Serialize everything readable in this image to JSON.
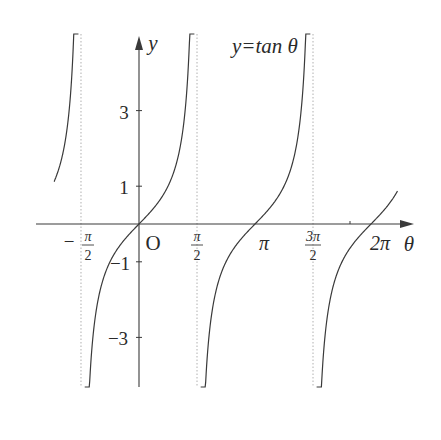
{
  "chart_data": {
    "type": "line",
    "title": "y=tan θ",
    "function": "tan",
    "xlabel": "θ",
    "ylabel": "y",
    "origin_label": "O",
    "x_range": [
      -2.3,
      7.0
    ],
    "y_range": [
      -5.0,
      5.0
    ],
    "x_ticks": [
      {
        "value": -1.5708,
        "label": "−π/2",
        "num": "π",
        "den": "2",
        "neg": true,
        "frac": true
      },
      {
        "value": 1.5708,
        "label": "π/2",
        "num": "π",
        "den": "2",
        "neg": false,
        "frac": true
      },
      {
        "value": 3.1416,
        "label": "π",
        "frac": false
      },
      {
        "value": 4.7124,
        "label": "3π/2",
        "num": "3π",
        "den": "2",
        "neg": false,
        "frac": true
      },
      {
        "value": 6.2832,
        "label": "2π",
        "frac": false
      }
    ],
    "y_ticks": [
      {
        "value": 3,
        "label": "3"
      },
      {
        "value": 1,
        "label": "1"
      },
      {
        "value": -1,
        "label": "−1"
      },
      {
        "value": -3,
        "label": "−3"
      }
    ],
    "asymptotes": [
      -1.5708,
      1.5708,
      4.7124
    ],
    "branches": [
      {
        "x_from": -2.3,
        "x_to": -1.64,
        "note": "right end of branch left of −π/2"
      },
      {
        "x_from": -1.47,
        "x_to": 1.5,
        "note": "principal branch through origin"
      },
      {
        "x_from": 1.67,
        "x_to": 4.64,
        "note": "branch through π"
      },
      {
        "x_from": 4.81,
        "x_to": 7.0,
        "note": "branch through 2π, clipped"
      }
    ],
    "grid": false,
    "legend": null
  },
  "colors": {
    "curve": "#3a3a3a",
    "axis": "#3a3a3a",
    "asymptote": "#b0b0b0",
    "background": "#ffffff"
  }
}
